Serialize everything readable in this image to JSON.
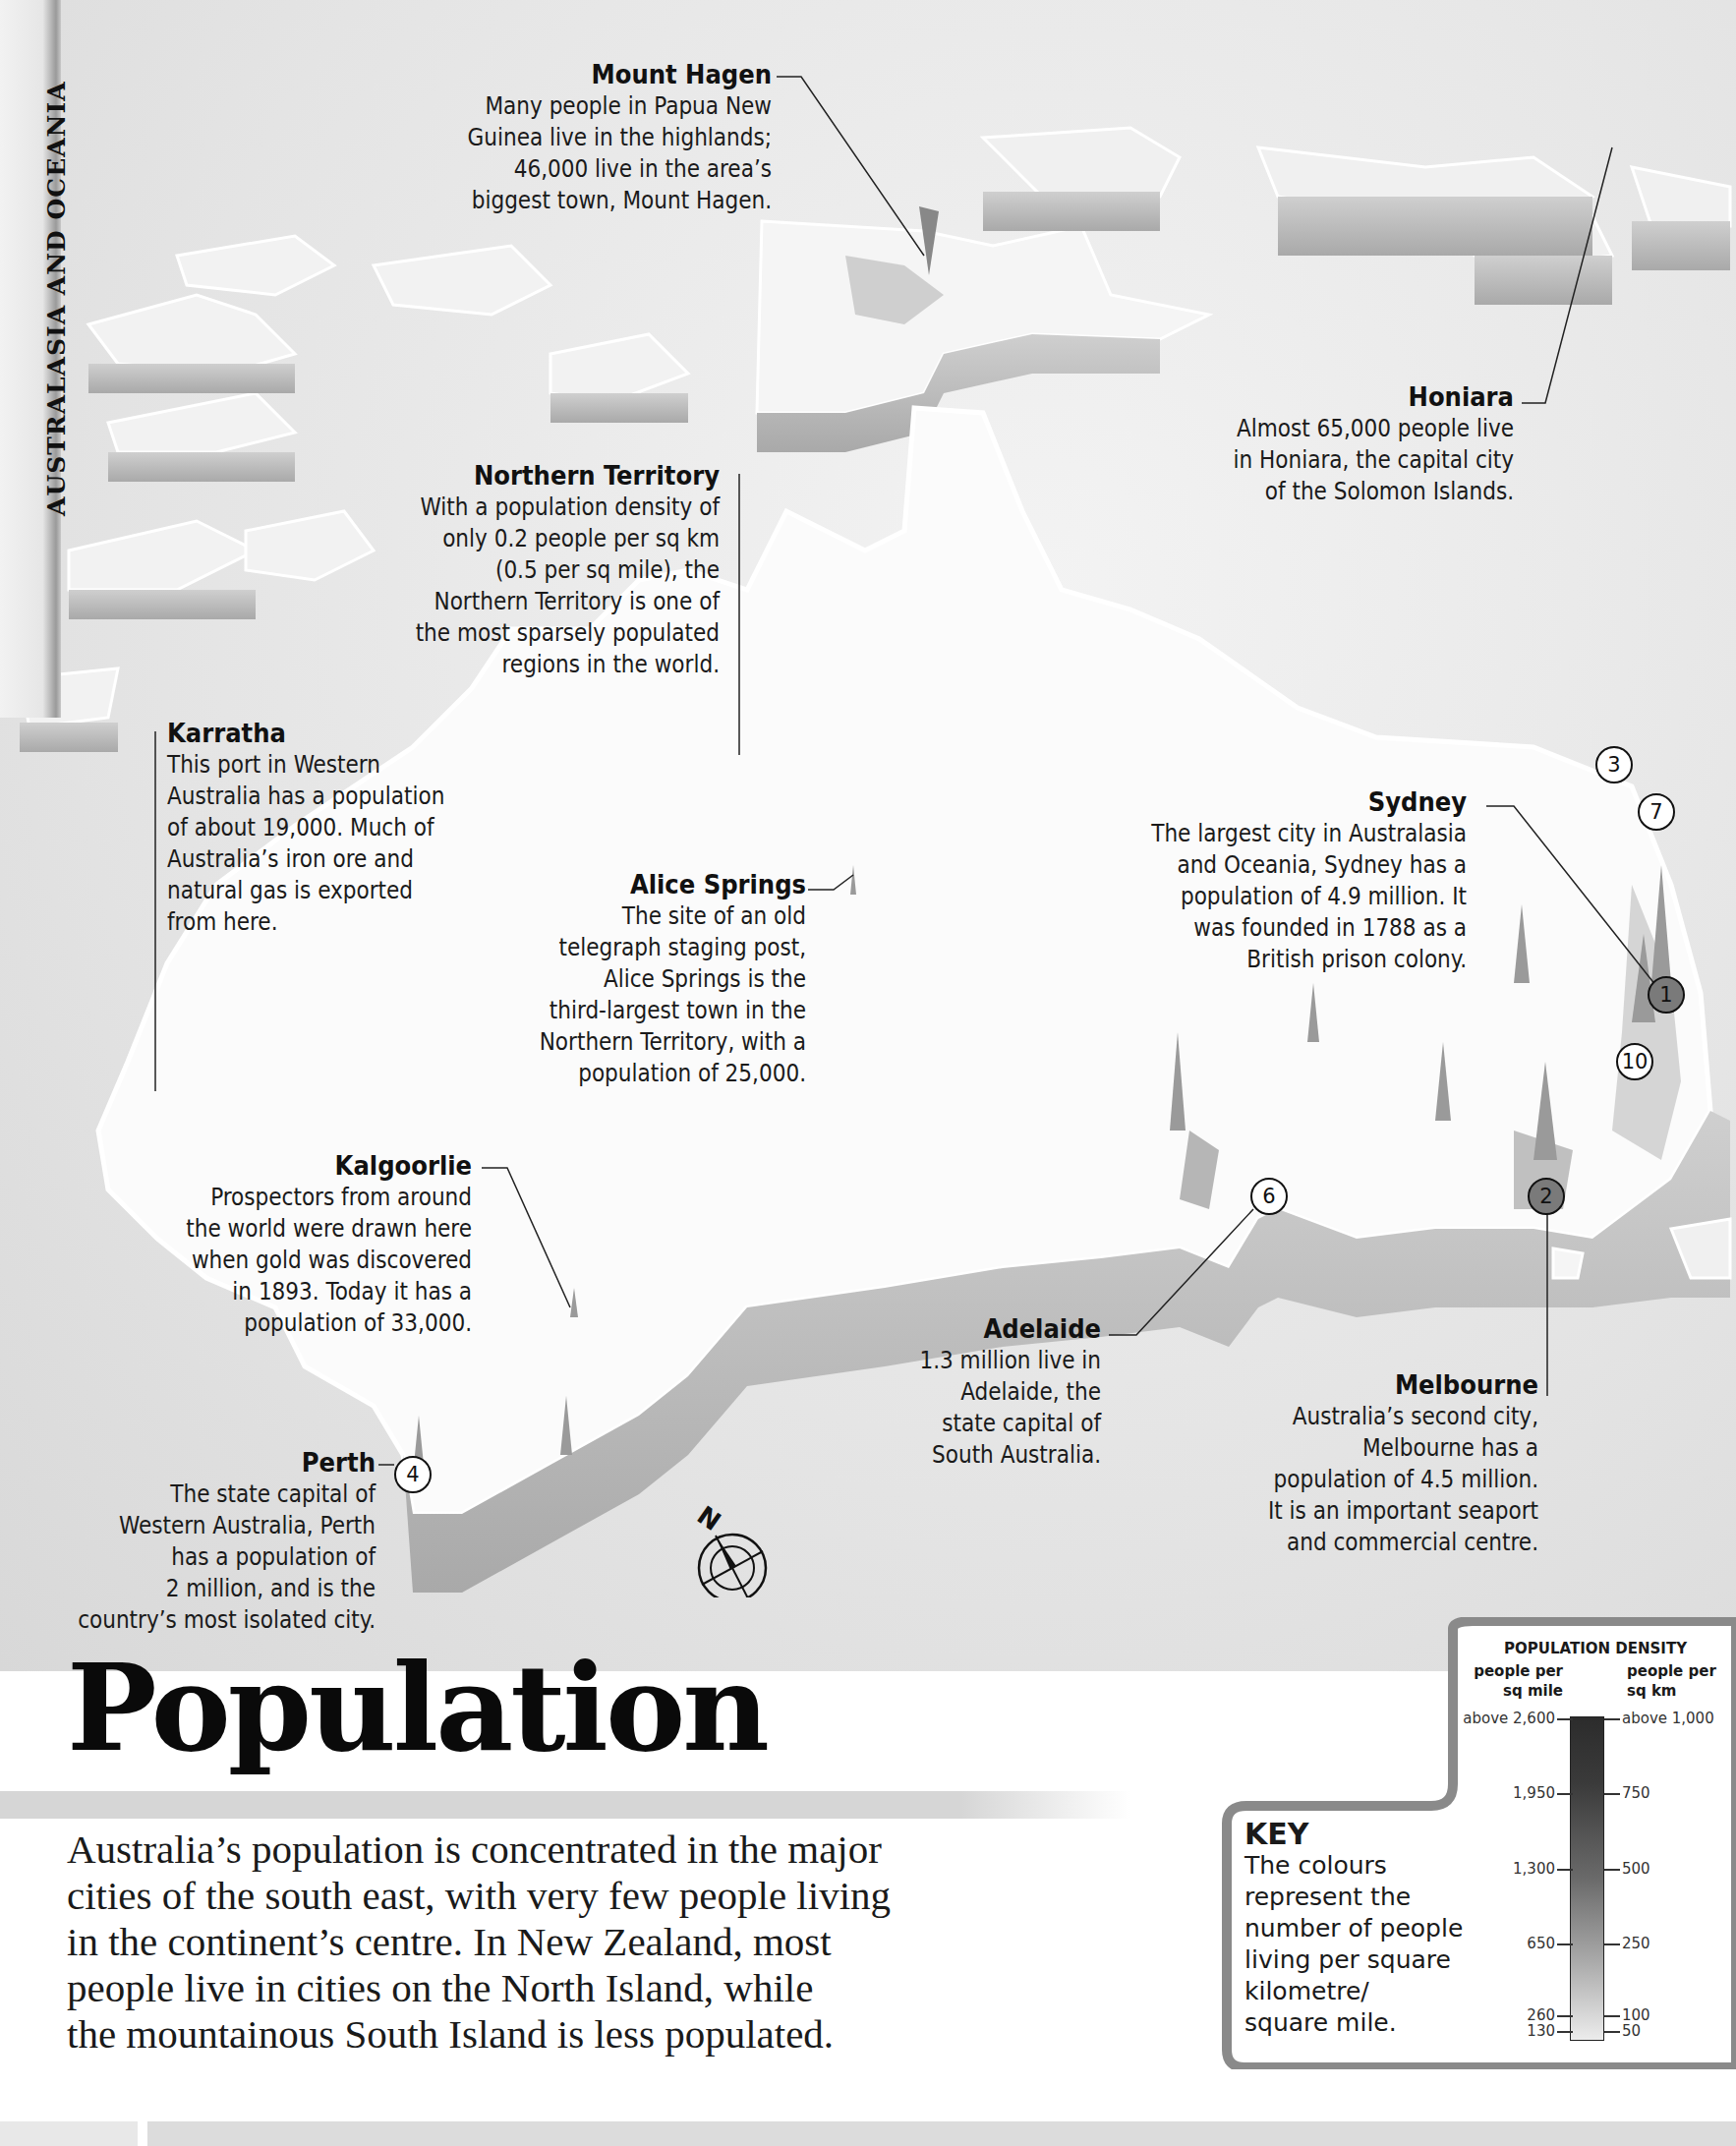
{
  "section_tab": "AUSTRALASIA AND OCEANIA",
  "title": "Population",
  "intro_lines": [
    "Australia’s population is concentrated in the major",
    "cities of the south east, with very few people living",
    "in the continent’s centre. In New Zealand, most",
    "people live in cities on the North Island, while",
    "the mountainous South Island is less populated."
  ],
  "annotations": {
    "mount_hagen": {
      "title": "Mount Hagen",
      "body": "Many people in Papua New\nGuinea live in the highlands;\n46,000 live in the area’s\nbiggest town, Mount Hagen."
    },
    "honiara": {
      "title": "Honiara",
      "body": "Almost 65,000 people live\nin Honiara, the capital city\nof the Solomon Islands."
    },
    "northern_territory": {
      "title": "Northern Territory",
      "body": "With a population density of\nonly 0.2 people per sq km\n(0.5 per sq mile), the\nNorthern Territory is one of\nthe most sparsely populated\nregions in the world."
    },
    "karratha": {
      "title": "Karratha",
      "body": "This port in Western\nAustralia has a population\nof about 19,000. Much of\nAustralia’s iron ore and\nnatural gas is exported\nfrom here."
    },
    "alice_springs": {
      "title": "Alice Springs",
      "body": "The site of an old\ntelegraph staging post,\nAlice Springs is the\nthird-largest town in the\nNorthern Territory, with a\npopulation of 25,000."
    },
    "sydney": {
      "title": "Sydney",
      "body": "The largest city in Australasia\nand Oceania, Sydney has a\npopulation of 4.9 million. It\nwas founded in 1788 as a\nBritish prison colony."
    },
    "kalgoorlie": {
      "title": "Kalgoorlie",
      "body": "Prospectors from around\nthe world were drawn here\nwhen gold was discovered\nin 1893. Today it has a\npopulation of 33,000."
    },
    "adelaide": {
      "title": "Adelaide",
      "body": "1.3 million live in\nAdelaide, the\nstate capital of\nSouth Australia."
    },
    "melbourne": {
      "title": "Melbourne",
      "body": "Australia’s second city,\nMelbourne has a\npopulation of 4.5 million.\nIt is an important seaport\nand commercial centre."
    },
    "perth": {
      "title": "Perth",
      "body": "The state capital of\nWestern Australia, Perth\nhas a population of\n2 million, and is the\ncountry’s most isolated city."
    }
  },
  "city_markers": [
    {
      "rank": "1",
      "city": "Sydney",
      "style": "dark"
    },
    {
      "rank": "2",
      "city": "Melbourne",
      "style": "dark"
    },
    {
      "rank": "3",
      "city": "",
      "style": "light"
    },
    {
      "rank": "4",
      "city": "Perth",
      "style": "light"
    },
    {
      "rank": "6",
      "city": "Adelaide",
      "style": "light"
    },
    {
      "rank": "7",
      "city": "",
      "style": "light"
    },
    {
      "rank": "10",
      "city": "",
      "style": "light"
    }
  ],
  "compass": {
    "north_label": "N",
    "icon": "compass-rose-icon"
  },
  "key": {
    "heading": "KEY",
    "body": "The colours\nrepresent the\nnumber of people\nliving per square\nkilometre/\nsquare mile.",
    "legend_title": "POPULATION DENSITY",
    "left_unit": "people per\nsq mile",
    "right_unit": "people per\nsq km",
    "ticks": [
      {
        "sq_mile": "above 2,600",
        "sq_km": "above 1,000"
      },
      {
        "sq_mile": "1,950",
        "sq_km": "750"
      },
      {
        "sq_mile": "1,300",
        "sq_km": "500"
      },
      {
        "sq_mile": "650",
        "sq_km": "250"
      },
      {
        "sq_mile": "260",
        "sq_km": "100"
      },
      {
        "sq_mile": "130",
        "sq_km": "50"
      }
    ],
    "colors": {
      "high": "#2c2c2c",
      "low": "#ececec"
    }
  }
}
